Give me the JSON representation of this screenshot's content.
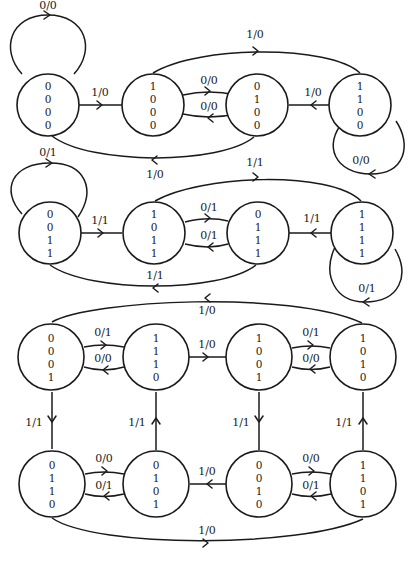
{
  "diagram": {
    "type": "state-transition-diagram",
    "states": [
      {
        "id": "s0000",
        "bits": [
          "0",
          "0",
          "0",
          "0"
        ],
        "cx": 48,
        "cy": 92
      },
      {
        "id": "s1000",
        "bits": [
          "1",
          "0",
          "0",
          "0"
        ],
        "cx": 160,
        "cy": 92
      },
      {
        "id": "s0100",
        "bits": [
          "0",
          "1",
          "0",
          "0"
        ],
        "cx": 258,
        "cy": 92
      },
      {
        "id": "s1100",
        "bits": [
          "1",
          "1",
          "0",
          "0"
        ],
        "cx": 371,
        "cy": 92
      },
      {
        "id": "s0011",
        "bits": [
          "0",
          "0",
          "1",
          "1"
        ],
        "cx": 48,
        "cy": 232
      },
      {
        "id": "s1011",
        "bits": [
          "1",
          "0",
          "1",
          "1"
        ],
        "cx": 160,
        "cy": 232
      },
      {
        "id": "s0111",
        "bits": [
          "0",
          "1",
          "1",
          "1"
        ],
        "cx": 258,
        "cy": 232
      },
      {
        "id": "s1111",
        "bits": [
          "1",
          "1",
          "1",
          "1"
        ],
        "cx": 371,
        "cy": 232
      },
      {
        "id": "s0001",
        "bits": [
          "0",
          "0",
          "0",
          "1"
        ],
        "cx": 50,
        "cy": 357
      },
      {
        "id": "s1110",
        "bits": [
          "1",
          "1",
          "1",
          "0"
        ],
        "cx": 155,
        "cy": 357
      },
      {
        "id": "s1001",
        "bits": [
          "1",
          "0",
          "0",
          "1"
        ],
        "cx": 259,
        "cy": 357
      },
      {
        "id": "s1010",
        "bits": [
          "1",
          "0",
          "1",
          "0"
        ],
        "cx": 363,
        "cy": 357
      },
      {
        "id": "s0110",
        "bits": [
          "0",
          "1",
          "1",
          "0"
        ],
        "cx": 52,
        "cy": 484
      },
      {
        "id": "s0101",
        "bits": [
          "0",
          "1",
          "0",
          "1"
        ],
        "cx": 155,
        "cy": 484
      },
      {
        "id": "s0010",
        "bits": [
          "0",
          "0",
          "1",
          "0"
        ],
        "cx": 259,
        "cy": 484
      },
      {
        "id": "s1101",
        "bits": [
          "1",
          "1",
          "0",
          "1"
        ],
        "cx": 363,
        "cy": 484
      }
    ],
    "transitions": [
      {
        "from": "s0000",
        "to": "s0000",
        "label": "0/0"
      },
      {
        "from": "s0000",
        "to": "s1000",
        "label": "1/0"
      },
      {
        "from": "s1000",
        "to": "s0100",
        "label": "0/0"
      },
      {
        "from": "s0100",
        "to": "s1000",
        "label": "0/0"
      },
      {
        "from": "s1000",
        "to": "s1100",
        "label": "1/0"
      },
      {
        "from": "s1100",
        "to": "s0100",
        "label": "1/0"
      },
      {
        "from": "s0100",
        "to": "s0000",
        "label": "1/0"
      },
      {
        "from": "s1100",
        "to": "s1100",
        "label": "0/0"
      },
      {
        "from": "s0011",
        "to": "s0011",
        "label": "0/1"
      },
      {
        "from": "s0011",
        "to": "s1011",
        "label": "1/1"
      },
      {
        "from": "s1011",
        "to": "s0111",
        "label": "0/1"
      },
      {
        "from": "s0111",
        "to": "s1011",
        "label": "0/1"
      },
      {
        "from": "s1011",
        "to": "s1111",
        "label": "1/1"
      },
      {
        "from": "s1111",
        "to": "s0111",
        "label": "1/1"
      },
      {
        "from": "s0111",
        "to": "s0011",
        "label": "1/1"
      },
      {
        "from": "s1111",
        "to": "s1111",
        "label": "0/1"
      },
      {
        "from": "s1010",
        "to": "s0001",
        "label": "1/0"
      },
      {
        "from": "s0001",
        "to": "s1110",
        "label": "0/1"
      },
      {
        "from": "s1110",
        "to": "s0001",
        "label": "0/0"
      },
      {
        "from": "s1110",
        "to": "s1001",
        "label": "1/0"
      },
      {
        "from": "s1001",
        "to": "s1010",
        "label": "0/1"
      },
      {
        "from": "s1010",
        "to": "s1001",
        "label": "0/0"
      },
      {
        "from": "s0001",
        "to": "s0110",
        "label": "1/1"
      },
      {
        "from": "s0101",
        "to": "s1110",
        "label": "1/1"
      },
      {
        "from": "s1001",
        "to": "s0010",
        "label": "1/1"
      },
      {
        "from": "s1101",
        "to": "s1010",
        "label": "1/1"
      },
      {
        "from": "s0110",
        "to": "s0101",
        "label": "0/0"
      },
      {
        "from": "s0101",
        "to": "s0110",
        "label": "0/1"
      },
      {
        "from": "s0010",
        "to": "s0101",
        "label": "1/0"
      },
      {
        "from": "s0010",
        "to": "s1101",
        "label": "0/0"
      },
      {
        "from": "s1101",
        "to": "s0010",
        "label": "0/1"
      },
      {
        "from": "s0110",
        "to": "s1101",
        "label": "1/0"
      }
    ]
  },
  "labels": {
    "r1_self_0000": "0/0",
    "r1_0000_1000": "1/0",
    "r1_1000_0100": "0/0",
    "r1_0100_1000": "0/0",
    "r1_1000_1100": "1/0",
    "r1_1100_0100": "1/0",
    "r1_0100_0000": "1/0",
    "r1_self_1100": "0/0",
    "r2_self_0011": "0/1",
    "r2_0011_1011": "1/1",
    "r2_1011_0111": "0/1",
    "r2_0111_1011": "0/1",
    "r2_1011_1111": "1/1",
    "r2_1111_0111": "1/1",
    "r2_0111_0011": "1/1",
    "r2_self_1111": "0/1",
    "r3_1010_0001": "1/0",
    "r3_0001_1110": "0/1",
    "r3_1110_0001": "0/0",
    "r3_1110_1001": "1/0",
    "r3_1001_1010": "0/1",
    "r3_1010_1001": "0/0",
    "v_0001_0110": "1/1",
    "v_0101_1110": "1/1",
    "v_1001_0010": "1/1",
    "v_1101_1010": "1/1",
    "r4_0110_0101": "0/0",
    "r4_0101_0110": "0/1",
    "r4_0010_0101": "1/0",
    "r4_0010_1101": "0/0",
    "r4_1101_0010": "0/1",
    "r4_0110_1101": "1/0"
  },
  "bits": {
    "s0000": [
      "0",
      "0",
      "0",
      "0"
    ],
    "s1000": [
      "1",
      "0",
      "0",
      "0"
    ],
    "s0100": [
      "0",
      "1",
      "0",
      "0"
    ],
    "s1100": [
      "1",
      "1",
      "0",
      "0"
    ],
    "s0011": [
      "0",
      "0",
      "1",
      "1"
    ],
    "s1011": [
      "1",
      "0",
      "1",
      "1"
    ],
    "s0111": [
      "0",
      "1",
      "1",
      "1"
    ],
    "s1111": [
      "1",
      "1",
      "1",
      "1"
    ],
    "s0001": [
      "0",
      "0",
      "0",
      "1"
    ],
    "s1110": [
      "1",
      "1",
      "1",
      "0"
    ],
    "s1001": [
      "1",
      "0",
      "0",
      "1"
    ],
    "s1010": [
      "1",
      "0",
      "1",
      "0"
    ],
    "s0110": [
      "0",
      "1",
      "1",
      "0"
    ],
    "s0101": [
      "0",
      "1",
      "0",
      "1"
    ],
    "s0010": [
      "0",
      "0",
      "1",
      "0"
    ],
    "s1101": [
      "1",
      "1",
      "0",
      "1"
    ]
  }
}
